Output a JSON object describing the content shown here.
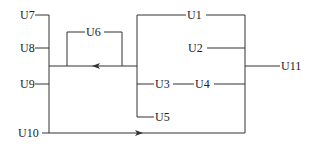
{
  "diagram": {
    "type": "block-connection-diagram",
    "nodes": [
      {
        "id": "U1",
        "label": "U1"
      },
      {
        "id": "U2",
        "label": "U2"
      },
      {
        "id": "U3",
        "label": "U3"
      },
      {
        "id": "U4",
        "label": "U4"
      },
      {
        "id": "U5",
        "label": "U5"
      },
      {
        "id": "U6",
        "label": "U6"
      },
      {
        "id": "U7",
        "label": "U7"
      },
      {
        "id": "U8",
        "label": "U8"
      },
      {
        "id": "U9",
        "label": "U9"
      },
      {
        "id": "U10",
        "label": "U10"
      },
      {
        "id": "U11",
        "label": "U11"
      }
    ],
    "arrows": [
      {
        "id": "middle-bus-arrow",
        "direction": "left"
      },
      {
        "id": "bottom-line-arrow",
        "direction": "right"
      }
    ],
    "colors": {
      "line": "#333333",
      "text": "#222222",
      "background": "#ffffff"
    }
  }
}
